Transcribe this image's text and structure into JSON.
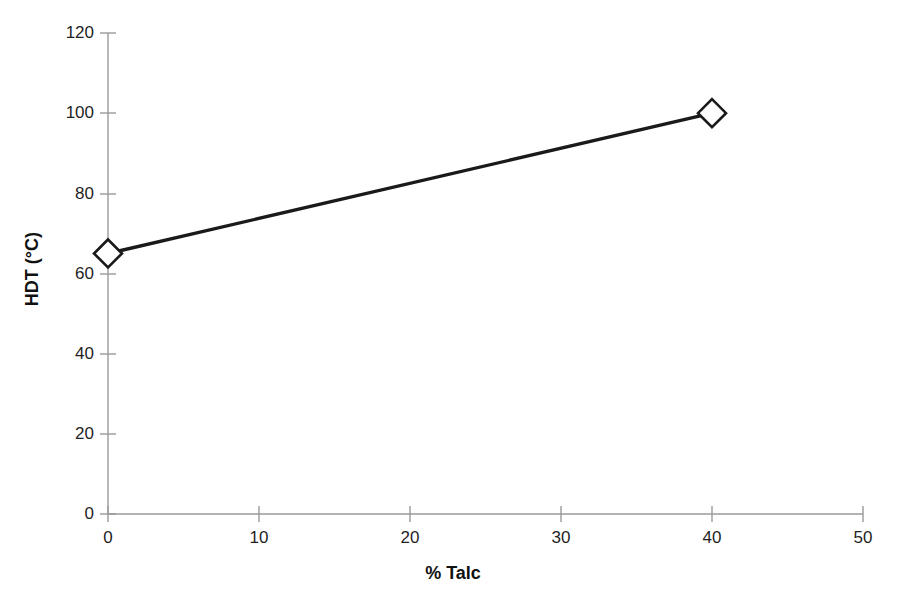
{
  "chart_data": {
    "type": "line",
    "title": "",
    "subtitle": "",
    "xlabel": "% Talc",
    "ylabel": "HDT (°C)",
    "xlim": [
      0,
      50
    ],
    "ylim": [
      0,
      120
    ],
    "xticks": [
      "0",
      "10",
      "20",
      "30",
      "40",
      "50"
    ],
    "yticks": [
      "0",
      "20",
      "40",
      "60",
      "80",
      "100",
      "120"
    ],
    "xtick_values": [
      0,
      10,
      20,
      30,
      40,
      50
    ],
    "ytick_values": [
      0,
      20,
      40,
      60,
      80,
      100,
      120
    ],
    "grid": false,
    "legend": false,
    "legend_position": "none",
    "marker": "open-diamond",
    "line_color": "#1a1a1a",
    "marker_fill": "#ffffff",
    "marker_edge": "#1a1a1a",
    "axis_color": "#8a8a8a",
    "background": "#ffffff",
    "series": [
      {
        "name": "HDT",
        "x": [
          0,
          40
        ],
        "values": [
          65,
          100
        ],
        "points": [
          {
            "x": 0,
            "y": 65
          },
          {
            "x": 40,
            "y": 100
          }
        ]
      }
    ],
    "annotations": []
  }
}
